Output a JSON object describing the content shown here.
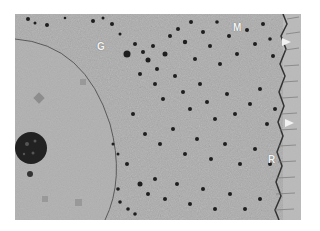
{
  "figure": {
    "labels": [
      {
        "text": "G",
        "x": 82,
        "y": 28
      },
      {
        "text": "M",
        "x": 218,
        "y": 9
      },
      {
        "text": "R",
        "x": 253,
        "y": 141
      }
    ],
    "arrowheads": [
      {
        "x": 267,
        "y": 24
      },
      {
        "x": 270,
        "y": 105
      }
    ],
    "colors": {
      "background": "#a9a9a9",
      "granules": "#1e1e1e",
      "nucleus_envelope": "#5a5a5a",
      "dense_body": "#222222",
      "label": "#f4f4f4"
    }
  }
}
